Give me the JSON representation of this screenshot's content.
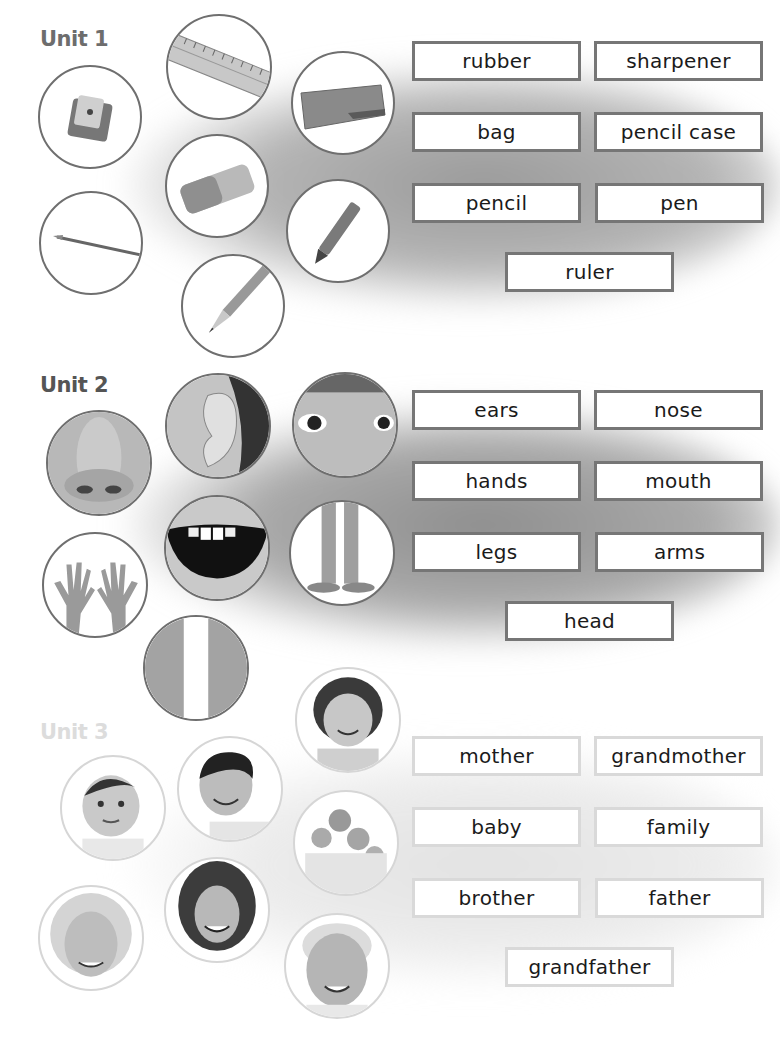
{
  "units": [
    {
      "heading": "Unit 1",
      "heading_color": "#6d6d6d",
      "pictures": [
        {
          "icon": "sharpener-icon",
          "cx": 90,
          "cy": 117
        },
        {
          "icon": "ruler-icon",
          "cx": 219,
          "cy": 67
        },
        {
          "icon": "pencil-case-icon",
          "cx": 343,
          "cy": 103
        },
        {
          "icon": "rubber-icon",
          "cx": 217,
          "cy": 186
        },
        {
          "icon": "pen-icon",
          "cx": 91,
          "cy": 243
        },
        {
          "icon": "crayon-icon",
          "cx": 338,
          "cy": 231
        },
        {
          "icon": "pencil-icon",
          "cx": 233,
          "cy": 306
        }
      ],
      "words": [
        "rubber",
        "sharpener",
        "bag",
        "pencil case",
        "pencil",
        "pen",
        "ruler"
      ]
    },
    {
      "heading": "Unit 2",
      "heading_color": "#555555",
      "pictures": [
        {
          "icon": "nose-photo-icon",
          "cx": 99,
          "cy": 463
        },
        {
          "icon": "ear-photo-icon",
          "cx": 218,
          "cy": 426
        },
        {
          "icon": "eyes-photo-icon",
          "cx": 345,
          "cy": 425
        },
        {
          "icon": "mouth-photo-icon",
          "cx": 217,
          "cy": 548
        },
        {
          "icon": "hands-photo-icon",
          "cx": 95,
          "cy": 585
        },
        {
          "icon": "legs-photo-icon",
          "cx": 342,
          "cy": 553
        },
        {
          "icon": "arms-photo-icon",
          "cx": 196,
          "cy": 668
        }
      ],
      "words": [
        "ears",
        "nose",
        "hands",
        "mouth",
        "legs",
        "arms",
        "head"
      ]
    },
    {
      "heading": "Unit 3",
      "heading_color": "#dcdcdc",
      "pictures": [
        {
          "icon": "girl-photo-icon",
          "cx": 348,
          "cy": 720
        },
        {
          "icon": "baby-photo-icon",
          "cx": 113,
          "cy": 808
        },
        {
          "icon": "boy-photo-icon",
          "cx": 230,
          "cy": 789
        },
        {
          "icon": "family-photo-icon",
          "cx": 346,
          "cy": 843
        },
        {
          "icon": "grandmother-photo-icon",
          "cx": 91,
          "cy": 938
        },
        {
          "icon": "mother-photo-icon",
          "cx": 217,
          "cy": 910
        },
        {
          "icon": "grandfather-photo-icon",
          "cx": 337,
          "cy": 966
        }
      ],
      "words": [
        "mother",
        "grandmother",
        "baby",
        "family",
        "brother",
        "father",
        "grandfather"
      ]
    }
  ]
}
